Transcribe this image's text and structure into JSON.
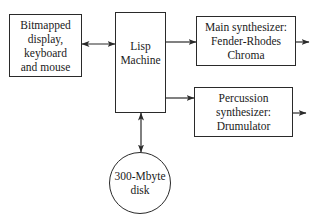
{
  "diagram": {
    "nodes": {
      "input_devices": {
        "lines": [
          "Bitmapped",
          "display,",
          "keyboard",
          "and mouse"
        ]
      },
      "lisp_machine": {
        "lines": [
          "Lisp",
          "Machine"
        ]
      },
      "main_synth": {
        "lines": [
          "Main synthesizer:",
          "Fender-Rhodes",
          "Chroma"
        ]
      },
      "percussion_synth": {
        "lines": [
          "Percussion",
          "synthesizer:",
          "Drumulator"
        ]
      },
      "disk": {
        "lines": [
          "300-Mbyte",
          "disk"
        ]
      }
    },
    "edges": [
      {
        "from": "input_devices",
        "to": "lisp_machine",
        "type": "bidirectional"
      },
      {
        "from": "lisp_machine",
        "to": "main_synth",
        "type": "directed"
      },
      {
        "from": "lisp_machine",
        "to": "percussion_synth",
        "type": "directed"
      },
      {
        "from": "lisp_machine",
        "to": "disk",
        "type": "bidirectional"
      },
      {
        "from": "main_synth",
        "to": "output",
        "type": "directed"
      },
      {
        "from": "percussion_synth",
        "to": "output",
        "type": "directed"
      }
    ],
    "colors": {
      "stroke": "#2a2a2a",
      "background": "#ffffff",
      "text": "#1a1a1a"
    }
  }
}
